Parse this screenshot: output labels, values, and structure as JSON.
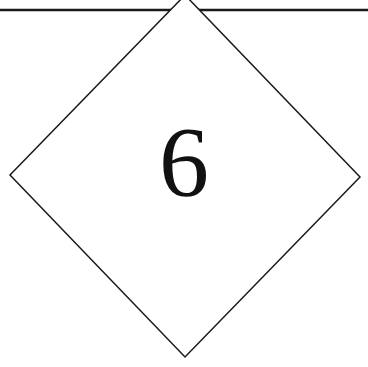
{
  "diagram": {
    "label": "6",
    "shape": "diamond",
    "stroke_color": "#1a1a1a",
    "fill_color": "#ffffff"
  }
}
